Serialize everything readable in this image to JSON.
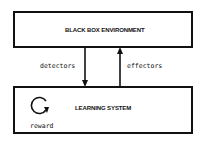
{
  "diagram": {
    "top_box": {
      "label": "BLACK BOX ENVIRONMENT"
    },
    "bottom_box": {
      "label": "LEARNING SYSTEM",
      "loop_label": "reward"
    },
    "arrows": [
      {
        "label": "detectors",
        "direction": "down",
        "from": "BLACK BOX ENVIRONMENT",
        "to": "LEARNING SYSTEM"
      },
      {
        "label": "effectors",
        "direction": "up",
        "from": "LEARNING SYSTEM",
        "to": "BLACK BOX ENVIRONMENT"
      }
    ]
  }
}
